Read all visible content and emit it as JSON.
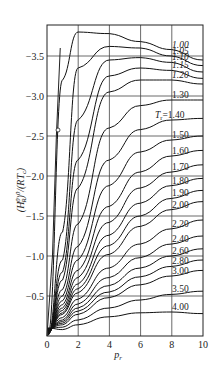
{
  "chart_data": {
    "type": "line",
    "title": "",
    "xlabel": "P_r",
    "ylabel": "(H_R^0)^0/(RT_c)",
    "xlim": [
      0,
      10
    ],
    "ylim": [
      0,
      -3.9
    ],
    "y_inverted": true,
    "grid": true,
    "x_ticks": [
      "0",
      "2",
      "4",
      "6",
      "8",
      "10"
    ],
    "y_ticks": [
      "-0.5",
      "-1.0",
      "-1.5",
      "-2.0",
      "-2.5",
      "-3.0",
      "-3.5"
    ],
    "legend_prefix": "T_r=",
    "x": [
      1,
      2,
      4,
      6,
      8,
      10
    ],
    "series": [
      {
        "name": "1.00",
        "values": [
          -3.2,
          -3.8,
          -3.78,
          -3.68,
          -3.58,
          -3.45
        ]
      },
      {
        "name": "1.05",
        "values": [
          -1.3,
          -3.35,
          -3.62,
          -3.6,
          -3.5,
          -3.38
        ]
      },
      {
        "name": "1.10",
        "values": [
          -0.95,
          -2.7,
          -3.45,
          -3.48,
          -3.42,
          -3.3
        ]
      },
      {
        "name": "1.15",
        "values": [
          -0.8,
          -2.2,
          -3.25,
          -3.35,
          -3.32,
          -3.22
        ]
      },
      {
        "name": "1.20",
        "values": [
          -0.7,
          -1.85,
          -3.05,
          -3.2,
          -3.2,
          -3.15
        ]
      },
      {
        "name": "1.30",
        "values": [
          -0.58,
          -1.4,
          -2.6,
          -2.88,
          -2.95,
          -2.95
        ]
      },
      {
        "name": "1.40",
        "values": [
          -0.5,
          -1.12,
          -2.2,
          -2.58,
          -2.7,
          -2.72
        ]
      },
      {
        "name": "1.50",
        "values": [
          -0.44,
          -0.95,
          -1.88,
          -2.3,
          -2.45,
          -2.5
        ]
      },
      {
        "name": "1.60",
        "values": [
          -0.39,
          -0.82,
          -1.62,
          -2.05,
          -2.25,
          -2.32
        ]
      },
      {
        "name": "1.70",
        "values": [
          -0.35,
          -0.73,
          -1.42,
          -1.85,
          -2.05,
          -2.14
        ]
      },
      {
        "name": "1.80",
        "values": [
          -0.32,
          -0.65,
          -1.26,
          -1.66,
          -1.88,
          -1.97
        ]
      },
      {
        "name": "1.90",
        "values": [
          -0.29,
          -0.59,
          -1.13,
          -1.5,
          -1.72,
          -1.82
        ]
      },
      {
        "name": "2.00",
        "values": [
          -0.27,
          -0.54,
          -1.02,
          -1.37,
          -1.58,
          -1.68
        ]
      },
      {
        "name": "2.20",
        "values": [
          -0.23,
          -0.46,
          -0.85,
          -1.15,
          -1.34,
          -1.45
        ]
      },
      {
        "name": "2.40",
        "values": [
          -0.2,
          -0.4,
          -0.73,
          -0.98,
          -1.15,
          -1.25
        ]
      },
      {
        "name": "2.60",
        "values": [
          -0.18,
          -0.35,
          -0.63,
          -0.85,
          -1.0,
          -1.09
        ]
      },
      {
        "name": "2.80",
        "values": [
          -0.16,
          -0.31,
          -0.55,
          -0.74,
          -0.87,
          -0.95
        ]
      },
      {
        "name": "3.00",
        "values": [
          -0.14,
          -0.27,
          -0.48,
          -0.64,
          -0.75,
          -0.82
        ]
      },
      {
        "name": "3.50",
        "values": [
          -0.11,
          -0.2,
          -0.35,
          -0.45,
          -0.52,
          -0.56
        ]
      },
      {
        "name": "4.00",
        "values": [
          -0.08,
          -0.14,
          -0.24,
          -0.29,
          -0.3,
          -0.28
        ]
      }
    ],
    "annotations": [
      "T_r=1.40 label",
      "small circle marker near P_r≈0.7, y≈-2.6"
    ]
  },
  "axis": {
    "xlabel_main": "p",
    "xlabel_sub": "r",
    "ylabel_text": "(H",
    "ylabel_full": "(H_R^0)^0/(RT_c)"
  },
  "labels": {
    "tr_prefix": "T",
    "tr_sub": "r",
    "tr_eq": "=1.40"
  }
}
